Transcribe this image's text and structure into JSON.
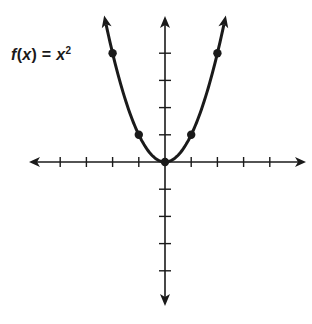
{
  "chart_data": {
    "type": "line",
    "function": "x^2",
    "label": {
      "f": "f",
      "open": "(",
      "var": "x",
      "close": ")",
      "eq": " = ",
      "base": "x",
      "exp": "2"
    },
    "xlabel": "",
    "ylabel": "",
    "x_range": [
      -5,
      5
    ],
    "y_range": [
      -5,
      5
    ],
    "x_ticks": [
      -4,
      -3,
      -2,
      -1,
      1,
      2,
      3,
      4
    ],
    "y_ticks": [
      -4,
      -3,
      -2,
      -1,
      1,
      2,
      3,
      4
    ],
    "tick_labels_shown": false,
    "grid": false,
    "axes_arrows": true,
    "curve_arrows": true,
    "points": [
      {
        "x": -2,
        "y": 4
      },
      {
        "x": -1,
        "y": 1
      },
      {
        "x": 0,
        "y": 0
      },
      {
        "x": 1,
        "y": 1
      },
      {
        "x": 2,
        "y": 4
      }
    ],
    "colors": {
      "line": "#1a1a1a",
      "background": "#ffffff"
    }
  }
}
